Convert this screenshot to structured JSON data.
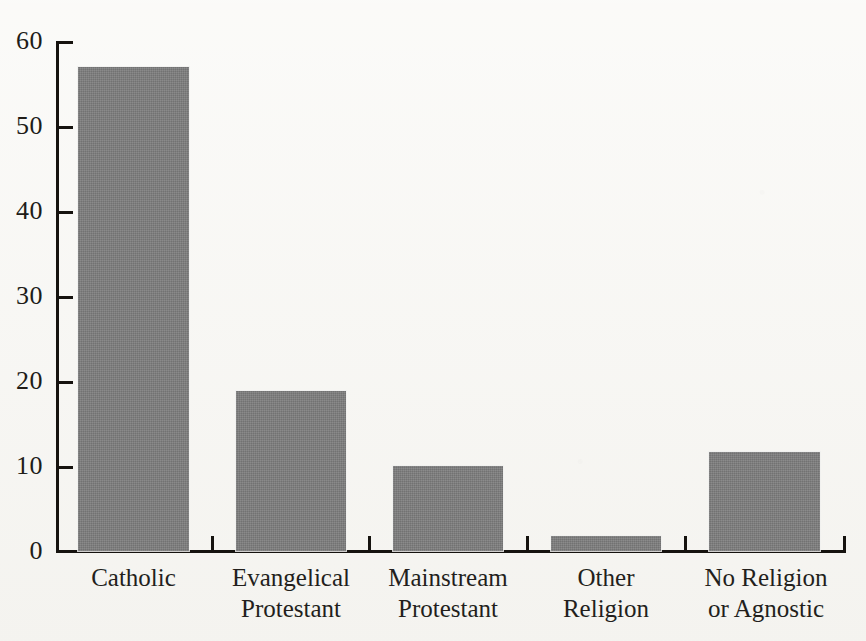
{
  "chart_data": {
    "type": "bar",
    "title": "",
    "subtitle": "",
    "xlabel": "",
    "ylabel": "",
    "categories": [
      "Catholic",
      "Evangelical\nProtestant",
      "Mainstream\nProtestant",
      "Other\nReligion",
      "No Religion\nor Agnostic"
    ],
    "values": [
      57.0,
      18.8,
      10.0,
      1.8,
      11.7
    ],
    "ylim": [
      0,
      60
    ],
    "yticks": [
      0,
      10,
      20,
      30,
      40,
      50,
      60
    ],
    "ytick_labels": [
      "0",
      "10",
      "20",
      "30",
      "40",
      "50",
      "60"
    ],
    "grid": false,
    "legend": false,
    "legend_position": "none",
    "bar_color": "#7e7e7e",
    "axis_color": "#16130f",
    "background_color": "#f7f6f2"
  },
  "axis": {
    "y_labels": [
      "60",
      "50",
      "40",
      "30",
      "20",
      "10",
      "0"
    ]
  },
  "bars": [
    {
      "label": "Catholic",
      "value": 57.0
    },
    {
      "label": "Evangelical\nProtestant",
      "value": 18.8
    },
    {
      "label": "Mainstream\nProtestant",
      "value": 10.0
    },
    {
      "label": "Other\nReligion",
      "value": 1.8
    },
    {
      "label": "No Religion\nor Agnostic",
      "value": 11.7
    }
  ]
}
